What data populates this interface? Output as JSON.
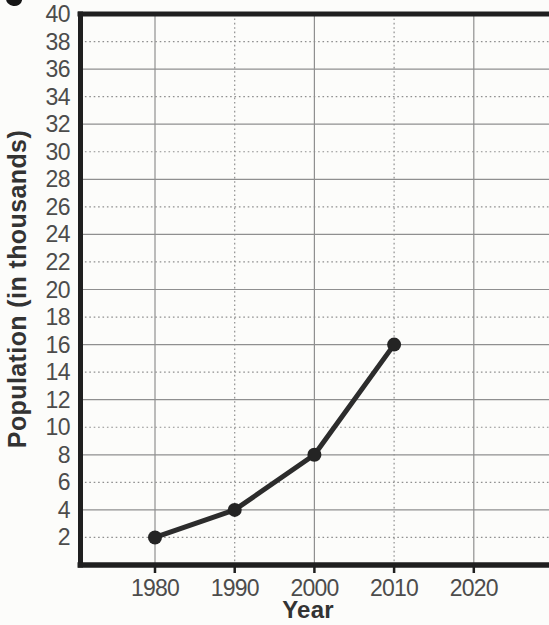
{
  "chart_data": {
    "type": "line",
    "title": "",
    "xlabel": "Year",
    "ylabel": "Population (in thousands)",
    "series": [
      {
        "name": "Population",
        "x": [
          1980,
          1990,
          2000,
          2010
        ],
        "y": [
          2,
          4,
          8,
          16
        ]
      }
    ],
    "x_ticks": [
      1980,
      1990,
      2000,
      2010,
      2020
    ],
    "y_ticks": [
      2,
      4,
      6,
      8,
      10,
      12,
      14,
      16,
      18,
      20,
      22,
      24,
      26,
      28,
      30,
      32,
      34,
      36,
      38,
      40
    ],
    "xlim": [
      1971,
      2029
    ],
    "ylim": [
      0,
      40
    ],
    "grid": true,
    "legend": "none",
    "colors": {
      "line": "#2c2c2c",
      "marker": "#242424",
      "grid": "#8f8f8f",
      "frame": "#1f1f1f",
      "tick_label": "#4c4c4c",
      "axis_title": "#333333",
      "background": "#fcfcfa"
    }
  }
}
